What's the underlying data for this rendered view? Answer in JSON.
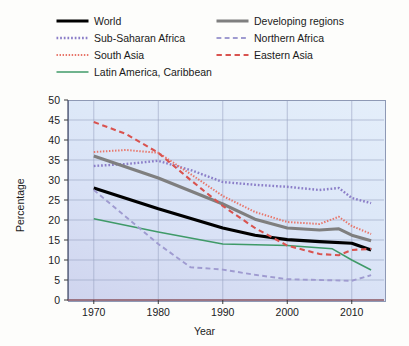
{
  "legend": {
    "entries": [
      {
        "label": "World",
        "color": "#000000",
        "style": "solid",
        "width": 3.1,
        "col": 0,
        "row": 0
      },
      {
        "label": "Sub-Saharan Africa",
        "color": "#8b7ec8",
        "style": "dotted",
        "width": 2.4,
        "col": 0,
        "row": 1
      },
      {
        "label": "South Asia",
        "color": "#e8766a",
        "style": "dotted",
        "width": 2.0,
        "col": 0,
        "row": 2
      },
      {
        "label": "Latin America, Caribbean",
        "color": "#3f9a68",
        "style": "solid",
        "width": 1.5,
        "col": 0,
        "row": 3
      },
      {
        "label": "Developing regions",
        "color": "#7f7f7f",
        "style": "solid",
        "width": 3.1,
        "col": 1,
        "row": 0
      },
      {
        "label": "Northern Africa",
        "color": "#9f9bd0",
        "style": "dashed",
        "width": 1.9,
        "col": 1,
        "row": 1
      },
      {
        "label": "Eastern Asia",
        "color": "#d9534f",
        "style": "dashed",
        "width": 2.1,
        "col": 1,
        "row": 2
      }
    ]
  },
  "chart_data": {
    "type": "line",
    "title": "",
    "xlabel": "Year",
    "ylabel": "Percentage",
    "xlim": [
      1966,
      2015
    ],
    "ylim": [
      0,
      50
    ],
    "xticks": [
      1970,
      1980,
      1990,
      2000,
      2010
    ],
    "yticks": [
      0,
      5,
      10,
      15,
      20,
      25,
      30,
      35,
      40,
      45,
      50
    ],
    "grid": true,
    "legend_position": "above-plot",
    "series": [
      {
        "name": "World",
        "color": "#000000",
        "style": "solid",
        "width": 3.1,
        "x": [
          1970,
          1980,
          1990,
          1995,
          2000,
          2005,
          2010,
          2013
        ],
        "y": [
          28.0,
          22.8,
          18.0,
          16.2,
          15.1,
          14.6,
          14.2,
          12.5
        ]
      },
      {
        "name": "Sub-Saharan Africa",
        "color": "#8b7ec8",
        "style": "dotted",
        "width": 2.4,
        "x": [
          1970,
          1975,
          1980,
          1985,
          1990,
          1995,
          2000,
          2005,
          2008,
          2010,
          2013
        ],
        "y": [
          33.5,
          34.0,
          34.8,
          32.5,
          29.5,
          28.8,
          28.3,
          27.5,
          28.0,
          25.5,
          24.2
        ]
      },
      {
        "name": "South Asia",
        "color": "#e8766a",
        "style": "dotted",
        "width": 2.0,
        "x": [
          1970,
          1975,
          1980,
          1985,
          1990,
          1995,
          2000,
          2005,
          2008,
          2010,
          2013
        ],
        "y": [
          37.0,
          37.5,
          36.8,
          31.5,
          26.0,
          22.0,
          19.5,
          19.0,
          20.8,
          18.5,
          16.5
        ]
      },
      {
        "name": "Latin America, Caribbean",
        "color": "#3f9a68",
        "style": "solid",
        "width": 1.5,
        "x": [
          1970,
          1980,
          1990,
          2000,
          2007,
          2010,
          2013
        ],
        "y": [
          20.3,
          17.0,
          14.0,
          13.6,
          12.8,
          10.0,
          7.5
        ]
      },
      {
        "name": "Developing regions",
        "color": "#7f7f7f",
        "style": "solid",
        "width": 3.1,
        "x": [
          1970,
          1980,
          1990,
          1995,
          2000,
          2005,
          2008,
          2010,
          2013
        ],
        "y": [
          36.0,
          30.5,
          24.0,
          20.2,
          18.0,
          17.5,
          17.8,
          16.2,
          14.8
        ]
      },
      {
        "name": "Northern Africa",
        "color": "#9f9bd0",
        "style": "dashed",
        "width": 1.9,
        "x": [
          1970,
          1980,
          1985,
          1990,
          1995,
          2000,
          2005,
          2010,
          2013
        ],
        "y": [
          27.5,
          14.0,
          8.2,
          7.6,
          6.3,
          5.2,
          5.0,
          4.8,
          6.2
        ]
      },
      {
        "name": "Eastern Asia",
        "color": "#d9534f",
        "style": "dashed",
        "width": 2.1,
        "x": [
          1970,
          1975,
          1980,
          1985,
          1990,
          1995,
          2000,
          2005,
          2008,
          2010,
          2013
        ],
        "y": [
          44.5,
          41.5,
          36.8,
          30.0,
          23.5,
          18.0,
          13.6,
          11.5,
          11.2,
          12.5,
          12.8
        ]
      }
    ]
  }
}
